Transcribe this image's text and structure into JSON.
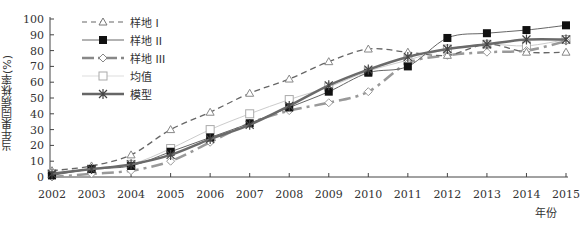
{
  "chart_data": {
    "type": "line",
    "title": "",
    "xlabel": "年份",
    "ylabel": "当年果园病株率(%)",
    "x": [
      2002,
      2003,
      2004,
      2005,
      2006,
      2007,
      2008,
      2009,
      2010,
      2011,
      2012,
      2013,
      2014,
      2015
    ],
    "ylim": [
      0,
      100
    ],
    "yticks": [
      0,
      10,
      20,
      30,
      40,
      50,
      60,
      70,
      80,
      90,
      100
    ],
    "grid": false,
    "legend_position": "upper left",
    "series": [
      {
        "name": "样地 I",
        "style": "dashed",
        "marker": "triangle-open",
        "color": "#666666",
        "values": [
          4,
          7,
          14,
          30,
          41,
          53,
          62,
          73,
          81,
          79,
          77,
          84,
          79,
          79
        ]
      },
      {
        "name": "样地 II",
        "style": "solid-thin",
        "marker": "square-filled",
        "color": "#555555",
        "values": [
          1,
          5,
          7,
          16,
          25,
          34,
          44,
          54,
          66,
          70,
          88,
          91,
          93,
          96
        ]
      },
      {
        "name": "样地 III",
        "style": "dash-dot-thick",
        "marker": "diamond-open",
        "color": "#888888",
        "values": [
          0,
          2,
          4,
          10,
          22,
          34,
          42,
          47,
          54,
          72,
          77,
          79,
          80,
          86
        ]
      },
      {
        "name": "均值",
        "style": "solid-light",
        "marker": "square-open",
        "color": "#bbbbbb",
        "values": [
          2,
          5,
          8,
          18,
          30,
          40,
          49,
          57,
          67,
          74,
          81,
          84,
          83,
          87
        ]
      },
      {
        "name": "模型",
        "style": "solid-thick",
        "marker": "asterisk",
        "color": "#666666",
        "values": [
          2,
          5,
          8,
          14,
          24,
          33,
          45,
          58,
          68,
          76,
          81,
          84,
          87,
          87
        ]
      }
    ]
  },
  "axis": {
    "ylabel": "当年果园病株率(%)",
    "xlabel": "年份"
  },
  "legend": [
    {
      "label": "样地 I"
    },
    {
      "label": "样地 II"
    },
    {
      "label": "样地 III"
    },
    {
      "label": "均值"
    },
    {
      "label": "模型"
    }
  ]
}
